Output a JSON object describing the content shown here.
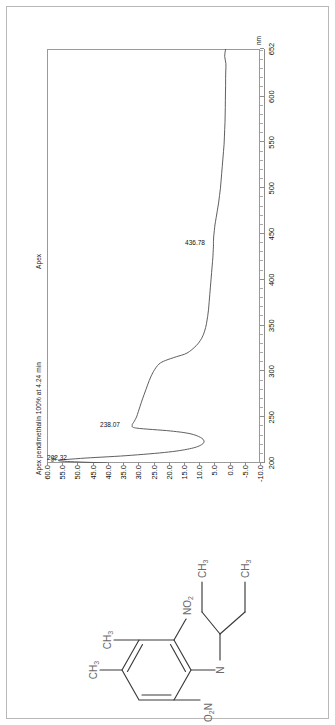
{
  "document": {
    "title": "Apex pendimethalin 100% at 4.24 min",
    "apex_label": "Apex",
    "orientation": "rotated-90-ccw"
  },
  "chart_data": {
    "type": "line",
    "title": "Apex pendimethalin 100% at 4.24 min",
    "subtitle": "Apex",
    "xlabel": "nm",
    "ylabel": "%",
    "xlim": [
      200,
      652
    ],
    "ylim": [
      -10.0,
      60.0
    ],
    "grid": false,
    "legend": "none",
    "x_ticks": [
      200,
      250,
      300,
      350,
      400,
      450,
      500,
      550,
      600,
      652
    ],
    "x_tick_labels": [
      "200",
      "250",
      "300",
      "350",
      "400",
      "450",
      "500",
      "550",
      "600",
      "652"
    ],
    "y_ticks": [
      60.0,
      55.0,
      50.0,
      45.0,
      40.0,
      35.0,
      30.0,
      25.0,
      20.0,
      15.0,
      10.0,
      5.0,
      0.0,
      -5.0,
      -10.0
    ],
    "y_tick_labels": [
      "60.0",
      "55.0",
      "50.0",
      "45.0",
      "40.0",
      "35.0",
      "30.0",
      "25.0",
      "20.0",
      "15.0",
      "10.0",
      "5.0",
      "0.0",
      "-5.0",
      "-10.0"
    ],
    "annotations": [
      {
        "label": "202.32",
        "x": 202.32,
        "y": 50.5
      },
      {
        "label": "238.07",
        "x": 238.07,
        "y": 33.0
      },
      {
        "label": "436.78",
        "x": 436.78,
        "y": 5.2
      }
    ],
    "series": [
      {
        "name": "UV spectrum",
        "color": "#4d4d4d",
        "x": [
          200,
          202.32,
          205,
          208,
          212,
          216,
          220,
          224,
          228,
          232,
          235,
          238.07,
          241,
          245,
          250,
          256,
          262,
          270,
          280,
          290,
          300,
          308,
          312,
          316,
          320,
          328,
          336,
          344,
          352,
          360,
          368,
          376,
          384,
          392,
          400,
          408,
          416,
          424,
          430,
          436.78,
          442,
          448,
          454,
          460,
          468,
          476,
          484,
          492,
          500,
          508,
          516,
          524,
          532,
          540,
          548,
          556,
          564,
          572,
          580,
          588,
          596,
          604,
          612,
          620,
          628,
          636,
          644,
          652
        ],
        "y": [
          40.2,
          56.0,
          49.0,
          34.0,
          20.0,
          12.5,
          9.2,
          8.4,
          9.6,
          13.0,
          19.5,
          30.5,
          32.0,
          31.4,
          30.6,
          30.0,
          29.4,
          28.6,
          27.5,
          26.4,
          25.0,
          23.2,
          21.0,
          17.5,
          14.0,
          11.0,
          9.2,
          8.2,
          7.6,
          7.2,
          6.9,
          6.7,
          6.5,
          6.3,
          6.1,
          5.9,
          5.7,
          5.5,
          5.4,
          5.3,
          5.3,
          5.2,
          5.0,
          4.8,
          4.4,
          4.0,
          3.6,
          3.3,
          3.0,
          2.8,
          2.6,
          2.4,
          2.2,
          2.0,
          1.8,
          1.7,
          1.6,
          1.5,
          1.45,
          1.4,
          1.38,
          1.35,
          1.3,
          1.3,
          1.25,
          1.2,
          1.6,
          1.3
        ]
      }
    ]
  },
  "structure": {
    "name": "pendimethalin-structure",
    "labels": [
      {
        "id": "ch3-top-left",
        "text": "CH",
        "sub": "3"
      },
      {
        "id": "ch3-top-right",
        "text": "CH",
        "sub": "3"
      },
      {
        "id": "no2-right",
        "text": "NO",
        "sub": "2"
      },
      {
        "id": "o2n-left",
        "text": "O",
        "sub": "2",
        "text2": "N"
      },
      {
        "id": "amine-n",
        "text": "N"
      },
      {
        "id": "ch3-chain-upper",
        "text": "CH",
        "sub": "3"
      },
      {
        "id": "ch3-chain-lower",
        "text": "CH",
        "sub": "3"
      }
    ]
  }
}
